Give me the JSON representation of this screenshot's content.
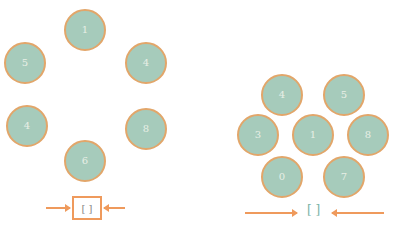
{
  "left_diagram": {
    "nodes": [
      {
        "label": "1",
        "x": 64,
        "y": 9
      },
      {
        "label": "5",
        "x": 4,
        "y": 42
      },
      {
        "label": "4",
        "x": 125,
        "y": 42
      },
      {
        "label": "4",
        "x": 6,
        "y": 105
      },
      {
        "label": "8",
        "x": 125,
        "y": 108
      },
      {
        "label": "6",
        "x": 64,
        "y": 140
      }
    ],
    "result": {
      "label": "[ ]"
    },
    "colors": {
      "node_fill": "#a6cbbb",
      "node_border": "#e2a66a",
      "arrow": "#ef9a5c"
    }
  },
  "right_diagram": {
    "nodes": [
      {
        "label": "4",
        "x": 261,
        "y": 74
      },
      {
        "label": "5",
        "x": 323,
        "y": 74
      },
      {
        "label": "3",
        "x": 237,
        "y": 114
      },
      {
        "label": "1",
        "x": 292,
        "y": 114
      },
      {
        "label": "8",
        "x": 347,
        "y": 114
      },
      {
        "label": "0",
        "x": 261,
        "y": 156
      },
      {
        "label": "7",
        "x": 323,
        "y": 156
      }
    ],
    "result": {
      "label": "[ ]"
    },
    "colors": {
      "node_fill": "#a6cbbb",
      "node_border": "#e2a66a",
      "arrow": "#ef9a5c"
    }
  }
}
